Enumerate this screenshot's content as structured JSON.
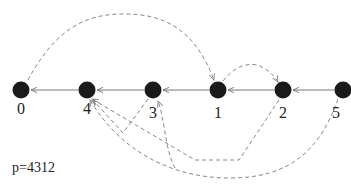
{
  "caption": "p=4312",
  "colors": {
    "node": "#1a1a1a",
    "edge": "#777777",
    "dashed": "#888888",
    "label": "#222222"
  },
  "nodes": [
    {
      "id": "0",
      "label": "0",
      "x": 21,
      "y": 90
    },
    {
      "id": "4",
      "label": "4",
      "x": 87,
      "y": 90
    },
    {
      "id": "3",
      "label": "3",
      "x": 153,
      "y": 90
    },
    {
      "id": "1",
      "label": "1",
      "x": 218,
      "y": 90
    },
    {
      "id": "2",
      "label": "2",
      "x": 283,
      "y": 90
    },
    {
      "id": "5",
      "label": "5",
      "x": 343,
      "y": 90
    }
  ],
  "solid_edges": [
    {
      "from": "4",
      "to": "0"
    },
    {
      "from": "3",
      "to": "4"
    },
    {
      "from": "1",
      "to": "3"
    },
    {
      "from": "2",
      "to": "1"
    },
    {
      "from": "5",
      "to": "2"
    }
  ],
  "dashed_edges": [
    {
      "from": "0",
      "to": "1"
    },
    {
      "from": "1",
      "to": "2"
    },
    {
      "from": "2",
      "to": "3"
    },
    {
      "from": "3",
      "to": "4"
    },
    {
      "from": "5",
      "to": "4"
    }
  ]
}
